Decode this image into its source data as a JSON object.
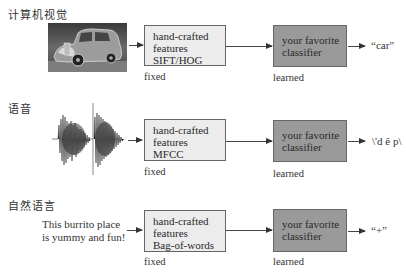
{
  "colors": {
    "feature_box_fill": "#ececec",
    "classifier_box_fill": "#9a9a9a",
    "border": "#666666"
  },
  "rows": [
    {
      "title": "计算机视觉",
      "input": {
        "type": "image",
        "icon": "car-photo"
      },
      "feature_box": {
        "line1": "hand-crafted",
        "line2": "features",
        "line3": "SIFT/HOG"
      },
      "feature_label": "fixed",
      "classifier_box": {
        "line1": "your favorite",
        "line2": "classifier"
      },
      "classifier_label": "learned",
      "output": "“car”"
    },
    {
      "title": "语音",
      "input": {
        "type": "waveform",
        "icon": "audio-waveform"
      },
      "feature_box": {
        "line1": "hand-crafted",
        "line2": "features",
        "line3": "MFCC"
      },
      "feature_label": "fixed",
      "classifier_box": {
        "line1": "your favorite",
        "line2": "classifier"
      },
      "classifier_label": "learned",
      "output": "\\'d ē p\\"
    },
    {
      "title": "自然语言",
      "input": {
        "type": "text",
        "line1": "This burrito place",
        "line2": "is yummy and fun!"
      },
      "feature_box": {
        "line1": "hand-crafted",
        "line2": "features",
        "line3": "Bag-of-words"
      },
      "feature_label": "fixed",
      "classifier_box": {
        "line1": "your favorite",
        "line2": "classifier"
      },
      "classifier_label": "learned",
      "output": "“+”"
    }
  ]
}
